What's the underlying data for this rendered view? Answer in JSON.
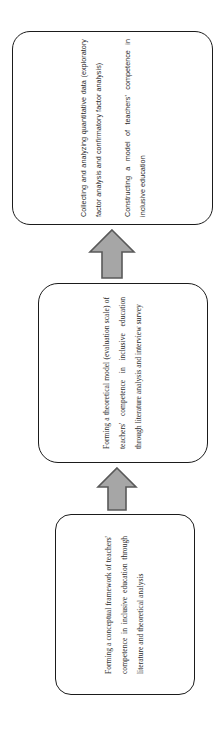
{
  "diagram": {
    "type": "flowchart",
    "orientation": "vertical-bottom-to-top",
    "page_rotation_degrees": -90,
    "colors": {
      "box_border": "#1b1b1b",
      "box_fill": "#ffffff",
      "arrow_fill": "#a6a6a6",
      "arrow_stroke": "#595959",
      "text": "#2a2a2a",
      "background": "#ffffff"
    },
    "nodes": [
      {
        "id": "framework",
        "order": 1,
        "name": "conceptual-framework-step",
        "paragraphs": [
          "Forming a conceptual framework of teachers' competence in inclusive education through literature and theoretical analysis"
        ]
      },
      {
        "id": "model",
        "order": 2,
        "name": "theoretical-model-step",
        "paragraphs": [
          "Forming a theoretical model (evaluation scale) of teachers' competence in inclusive education through literature analysis and interview survey"
        ]
      },
      {
        "id": "analysis",
        "order": 3,
        "name": "quantitative-analysis-step",
        "paragraphs": [
          "Collecting and analyzing quantitative data (exploratory factor analysis and confirmatory factor analysis)",
          "Constructing a model of teachers' competence in inclusive education"
        ]
      }
    ],
    "arrows": [
      {
        "id": "framework-to-model",
        "name": "arrow-up-framework-to-model",
        "from": "framework",
        "to": "model",
        "direction": "up"
      },
      {
        "id": "model-to-analysis",
        "name": "arrow-up-model-to-analysis",
        "from": "model",
        "to": "analysis",
        "direction": "up"
      }
    ]
  }
}
